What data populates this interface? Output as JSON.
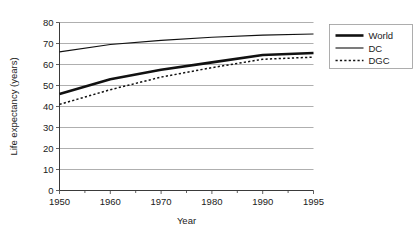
{
  "chart_data": {
    "type": "line",
    "title": "",
    "xlabel": "Year",
    "ylabel": "Life expectancy (years)",
    "categories": [
      "1950",
      "1960",
      "1970",
      "1980",
      "1990",
      "1995"
    ],
    "x_tick_labels": [
      "1950",
      "1960",
      "1970",
      "1980",
      "1990",
      "1995"
    ],
    "y_tick_labels": [
      "0",
      "10",
      "20",
      "30",
      "40",
      "50",
      "60",
      "70",
      "80"
    ],
    "y_ticks": [
      0,
      10,
      20,
      30,
      40,
      50,
      60,
      70,
      80
    ],
    "ylim": [
      0,
      80
    ],
    "grid": "horizontal",
    "legend_position": "right",
    "series": [
      {
        "name": "World",
        "style": "thick-solid",
        "color": "#111111",
        "values": [
          46.0,
          53.0,
          57.5,
          61.0,
          64.5,
          65.5
        ]
      },
      {
        "name": "DC",
        "style": "thin-solid",
        "color": "#111111",
        "values": [
          66.0,
          69.5,
          71.5,
          73.0,
          74.0,
          74.5
        ]
      },
      {
        "name": "DGC",
        "style": "dotted",
        "color": "#111111",
        "values": [
          41.0,
          48.0,
          54.0,
          58.5,
          62.5,
          63.5
        ]
      }
    ]
  },
  "legend": {
    "entries": [
      {
        "label": "World",
        "style": "thick-solid"
      },
      {
        "label": "DC",
        "style": "thin-solid"
      },
      {
        "label": "DGC",
        "style": "dotted"
      }
    ]
  },
  "axes": {
    "x_title": "Year",
    "y_title": "Life expectancy (years)"
  }
}
